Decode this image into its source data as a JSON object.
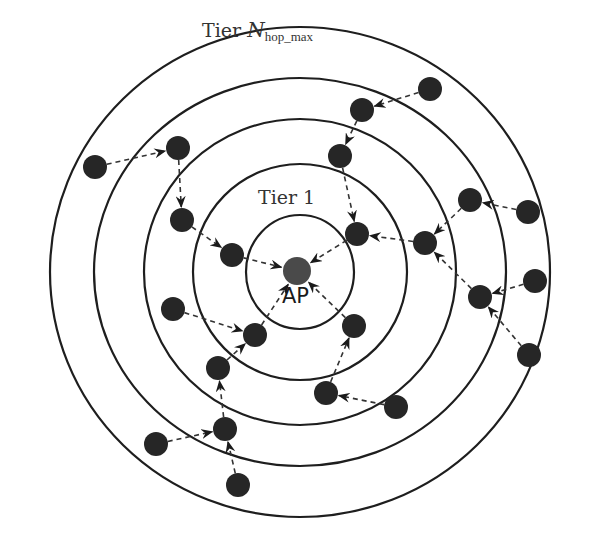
{
  "diagram": {
    "title_outer_tier": {
      "prefix": "Tier ",
      "symbol": "N",
      "subscript": "hop_max"
    },
    "title_inner_tier": "Tier 1",
    "center_label": "AP",
    "colors": {
      "ring": "#1e1e1e",
      "node": "#262626",
      "ap": "#4a4a4a",
      "link": "#333333",
      "background": "#ffffff"
    },
    "center": [
      300,
      272
    ],
    "rings": [
      {
        "rx": 54,
        "ry": 57
      },
      {
        "rx": 107,
        "ry": 108
      },
      {
        "rx": 156,
        "ry": 153
      },
      {
        "rx": 206,
        "ry": 194
      },
      {
        "rx": 250,
        "ry": 245
      }
    ],
    "ap": {
      "x": 297,
      "y": 271,
      "r": 14
    },
    "nodes": [
      {
        "id": "n1",
        "x": 95,
        "y": 167
      },
      {
        "id": "n2",
        "x": 178,
        "y": 148
      },
      {
        "id": "n3",
        "x": 182,
        "y": 220
      },
      {
        "id": "n4",
        "x": 232,
        "y": 255
      },
      {
        "id": "n5",
        "x": 173,
        "y": 309
      },
      {
        "id": "n6",
        "x": 255,
        "y": 335
      },
      {
        "id": "n7",
        "x": 218,
        "y": 368
      },
      {
        "id": "n8",
        "x": 225,
        "y": 429
      },
      {
        "id": "n9",
        "x": 156,
        "y": 444
      },
      {
        "id": "n10",
        "x": 238,
        "y": 485
      },
      {
        "id": "n11",
        "x": 354,
        "y": 326
      },
      {
        "id": "n12",
        "x": 326,
        "y": 393
      },
      {
        "id": "n13",
        "x": 396,
        "y": 407
      },
      {
        "id": "n14",
        "x": 357,
        "y": 234
      },
      {
        "id": "n15",
        "x": 340,
        "y": 156
      },
      {
        "id": "n16",
        "x": 362,
        "y": 110
      },
      {
        "id": "n17",
        "x": 430,
        "y": 89
      },
      {
        "id": "n18",
        "x": 425,
        "y": 243
      },
      {
        "id": "n19",
        "x": 470,
        "y": 200
      },
      {
        "id": "n20",
        "x": 528,
        "y": 212
      },
      {
        "id": "n21",
        "x": 480,
        "y": 297
      },
      {
        "id": "n22",
        "x": 535,
        "y": 281
      },
      {
        "id": "n23",
        "x": 529,
        "y": 355
      }
    ],
    "links": [
      {
        "from": "n1",
        "to": "n2"
      },
      {
        "from": "n2",
        "to": "n3"
      },
      {
        "from": "n3",
        "to": "n4"
      },
      {
        "from": "n4",
        "to": "ap"
      },
      {
        "from": "n5",
        "to": "n6"
      },
      {
        "from": "n6",
        "to": "ap"
      },
      {
        "from": "n7",
        "to": "n6"
      },
      {
        "from": "n8",
        "to": "n7"
      },
      {
        "from": "n9",
        "to": "n8"
      },
      {
        "from": "n10",
        "to": "n8"
      },
      {
        "from": "n11",
        "to": "ap"
      },
      {
        "from": "n12",
        "to": "n11"
      },
      {
        "from": "n13",
        "to": "n12"
      },
      {
        "from": "n14",
        "to": "ap"
      },
      {
        "from": "n15",
        "to": "n14"
      },
      {
        "from": "n16",
        "to": "n15"
      },
      {
        "from": "n17",
        "to": "n16"
      },
      {
        "from": "n18",
        "to": "n14"
      },
      {
        "from": "n19",
        "to": "n18"
      },
      {
        "from": "n20",
        "to": "n19"
      },
      {
        "from": "n21",
        "to": "n18"
      },
      {
        "from": "n22",
        "to": "n21"
      },
      {
        "from": "n23",
        "to": "n21"
      }
    ],
    "node_radius": 12
  }
}
